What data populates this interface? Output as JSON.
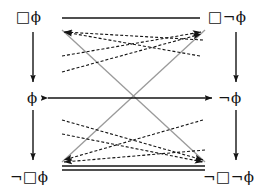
{
  "diagram": {
    "nodes": [
      {
        "id": "box-phi",
        "label": "□ϕ",
        "position": "top-left"
      },
      {
        "id": "box-not-phi",
        "label": "□¬ϕ",
        "position": "top-right"
      },
      {
        "id": "phi",
        "label": "ϕ",
        "position": "middle-left"
      },
      {
        "id": "not-phi",
        "label": "¬ϕ",
        "position": "middle-right"
      },
      {
        "id": "not-box-phi",
        "label": "¬□ϕ",
        "position": "bottom-left"
      },
      {
        "id": "not-box-not-phi",
        "label": "¬□¬ϕ",
        "position": "bottom-right"
      }
    ],
    "edges": [
      {
        "id": "top-line",
        "from": "box-phi",
        "to": "box-not-phi",
        "style": "plain-line",
        "arrows": "none"
      },
      {
        "id": "middle-biarrow",
        "from": "phi",
        "to": "not-phi",
        "style": "solid",
        "arrows": "both"
      },
      {
        "id": "bottom-double-line",
        "from": "not-box-phi",
        "to": "not-box-not-phi",
        "style": "double-line",
        "arrows": "none"
      },
      {
        "id": "left-vertical",
        "from": "box-phi",
        "to": "phi",
        "style": "solid",
        "arrows": "down"
      },
      {
        "id": "right-vertical",
        "from": "box-not-phi",
        "to": "not-phi",
        "style": "solid",
        "arrows": "down"
      },
      {
        "id": "left-lower-vertical",
        "from": "phi",
        "to": "not-box-phi",
        "style": "solid",
        "arrows": "down"
      },
      {
        "id": "right-lower-vertical",
        "from": "not-phi",
        "to": "not-box-not-phi",
        "style": "solid",
        "arrows": "down"
      },
      {
        "id": "diagonal-gray-down",
        "from": "box-phi",
        "to": "not-box-not-phi",
        "style": "gray-solid",
        "arrows": "none"
      },
      {
        "id": "diagonal-gray-up",
        "from": "not-box-phi",
        "to": "box-not-phi",
        "style": "gray-solid",
        "arrows": "none"
      },
      {
        "id": "dashed-ul-1",
        "from": "not-phi",
        "to": "box-phi",
        "style": "dashed",
        "arrows": "to"
      },
      {
        "id": "dashed-ul-2",
        "from": "not-box-not-phi",
        "to": "box-phi",
        "style": "dashed",
        "arrows": "to"
      },
      {
        "id": "dashed-ur-1",
        "from": "phi",
        "to": "box-not-phi",
        "style": "dashed",
        "arrows": "to"
      },
      {
        "id": "dashed-ur-2",
        "from": "not-box-phi",
        "to": "box-not-phi",
        "style": "dashed",
        "arrows": "to"
      },
      {
        "id": "dashed-dl-1",
        "from": "not-phi",
        "to": "not-box-phi",
        "style": "dashed",
        "arrows": "to"
      },
      {
        "id": "dashed-dl-2",
        "from": "box-not-phi",
        "to": "not-box-phi",
        "style": "dashed",
        "arrows": "to"
      },
      {
        "id": "dashed-dr-1",
        "from": "phi",
        "to": "not-box-not-phi",
        "style": "dashed",
        "arrows": "to"
      },
      {
        "id": "dashed-dr-2",
        "from": "box-phi",
        "to": "not-box-not-phi",
        "style": "dashed",
        "arrows": "to"
      }
    ],
    "colors": {
      "ink": "#141414",
      "gray_edge": "#9a9a9a",
      "background": "#ffffff"
    }
  }
}
